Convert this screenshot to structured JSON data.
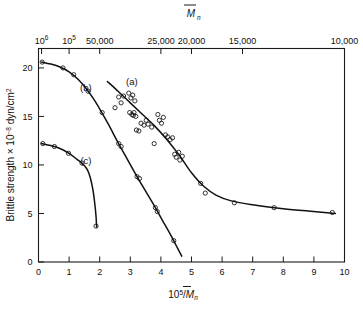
{
  "figure": {
    "width": 363,
    "height": 309,
    "background": "#ffffff",
    "ink_color": "#111111"
  },
  "chart_data": {
    "type": "scatter",
    "title": "",
    "subtitle": "",
    "xlabel": "10⁵/M̄ₙ",
    "ylabel": "Brittle strength × 10⁻⁸ dyn/cm²",
    "top_axis_label": "M̄ₙ",
    "xlim": [
      0,
      10
    ],
    "ylim": [
      0,
      22
    ],
    "grid": false,
    "legend_position": "inline-curve-labels",
    "x_ticks": [
      0,
      1,
      2,
      3,
      4,
      5,
      6,
      7,
      8,
      9,
      10
    ],
    "x_tick_labels": [
      "0",
      "1",
      "2",
      "3",
      "4",
      "5",
      "6",
      "7",
      "8",
      "9",
      "10"
    ],
    "y_ticks": [
      0,
      5,
      10,
      15,
      20
    ],
    "y_tick_labels": [
      "0",
      "5",
      "10",
      "15",
      "20"
    ],
    "top_ticks": [
      {
        "x": 0.1,
        "label": "10⁶",
        "sup": "6",
        "base": "10"
      },
      {
        "x": 1.0,
        "label": "10⁵",
        "sup": "5",
        "base": "10"
      },
      {
        "x": 2.0,
        "label": "50,000",
        "sup": "",
        "base": "50,000"
      },
      {
        "x": 4.0,
        "label": "25,000",
        "sup": "",
        "base": "25,000"
      },
      {
        "x": 5.0,
        "label": "20,000",
        "sup": "",
        "base": "20,000"
      },
      {
        "x": 6.667,
        "label": "15,000",
        "sup": "",
        "base": "15,000"
      },
      {
        "x": 10.0,
        "label": "10,000",
        "sup": "",
        "base": "10,000"
      }
    ],
    "series": [
      {
        "name": "(a)",
        "label": "(a)",
        "label_x": 3.05,
        "label_y": 18.2,
        "marker": "open-circle",
        "fit_curve": [
          [
            2.25,
            18.6
          ],
          [
            2.6,
            17.6
          ],
          [
            3.0,
            16.4
          ],
          [
            3.4,
            15.2
          ],
          [
            3.8,
            14.0
          ],
          [
            4.2,
            12.6
          ],
          [
            4.6,
            11.0
          ],
          [
            5.0,
            9.2
          ],
          [
            5.4,
            7.8
          ],
          [
            5.8,
            6.9
          ],
          [
            6.3,
            6.3
          ],
          [
            7.0,
            5.9
          ],
          [
            8.0,
            5.5
          ],
          [
            9.0,
            5.2
          ],
          [
            9.7,
            5.0
          ]
        ],
        "points": [
          [
            2.62,
            17.0
          ],
          [
            2.7,
            16.4
          ],
          [
            2.78,
            17.1
          ],
          [
            2.95,
            17.4
          ],
          [
            3.02,
            16.9
          ],
          [
            3.08,
            17.2
          ],
          [
            3.15,
            16.6
          ],
          [
            2.5,
            15.9
          ],
          [
            2.98,
            15.4
          ],
          [
            3.05,
            15.2
          ],
          [
            3.1,
            15.1
          ],
          [
            3.12,
            15.4
          ],
          [
            3.18,
            15.0
          ],
          [
            3.35,
            14.3
          ],
          [
            3.45,
            14.1
          ],
          [
            3.52,
            14.6
          ],
          [
            3.58,
            14.2
          ],
          [
            3.7,
            13.9
          ],
          [
            3.2,
            13.6
          ],
          [
            3.28,
            13.5
          ],
          [
            3.9,
            15.2
          ],
          [
            3.95,
            14.6
          ],
          [
            4.02,
            14.3
          ],
          [
            4.08,
            14.9
          ],
          [
            4.15,
            13.1
          ],
          [
            4.22,
            12.9
          ],
          [
            4.3,
            12.6
          ],
          [
            4.38,
            12.8
          ],
          [
            3.78,
            12.2
          ],
          [
            4.45,
            11.1
          ],
          [
            4.5,
            10.8
          ],
          [
            4.58,
            11.3
          ],
          [
            4.62,
            10.5
          ],
          [
            4.7,
            10.9
          ],
          [
            5.3,
            8.1
          ],
          [
            5.45,
            7.1
          ],
          [
            6.4,
            6.1
          ],
          [
            7.7,
            5.6
          ],
          [
            9.6,
            5.1
          ]
        ]
      },
      {
        "name": "(b)",
        "label": "(b)",
        "label_x": 1.55,
        "label_y": 17.6,
        "marker": "open-circle",
        "fit_curve": [
          [
            0.1,
            20.6
          ],
          [
            0.4,
            20.4
          ],
          [
            0.7,
            20.1
          ],
          [
            1.0,
            19.6
          ],
          [
            1.3,
            18.8
          ],
          [
            1.55,
            17.9
          ],
          [
            1.8,
            16.8
          ],
          [
            2.05,
            15.5
          ],
          [
            2.3,
            14.1
          ],
          [
            2.6,
            12.3
          ],
          [
            2.9,
            10.6
          ],
          [
            3.2,
            8.9
          ],
          [
            3.5,
            7.3
          ],
          [
            3.8,
            5.7
          ],
          [
            4.05,
            4.3
          ],
          [
            4.3,
            2.9
          ],
          [
            4.5,
            1.7
          ],
          [
            4.68,
            0.6
          ]
        ],
        "points": [
          [
            0.12,
            20.6
          ],
          [
            0.8,
            20.0
          ],
          [
            1.15,
            19.3
          ],
          [
            1.62,
            17.6
          ],
          [
            2.08,
            15.4
          ],
          [
            2.62,
            12.2
          ],
          [
            2.7,
            11.9
          ],
          [
            3.22,
            8.8
          ],
          [
            3.3,
            8.6
          ],
          [
            3.82,
            5.6
          ],
          [
            3.88,
            5.2
          ],
          [
            4.42,
            2.2
          ]
        ]
      },
      {
        "name": "(c)",
        "label": "(c)",
        "label_x": 1.55,
        "label_y": 10.1,
        "marker": "open-circle",
        "fit_curve": [
          [
            0.1,
            12.2
          ],
          [
            0.4,
            12.0
          ],
          [
            0.7,
            11.7
          ],
          [
            1.0,
            11.2
          ],
          [
            1.25,
            10.6
          ],
          [
            1.45,
            10.1
          ],
          [
            1.6,
            9.5
          ],
          [
            1.7,
            8.6
          ],
          [
            1.78,
            7.4
          ],
          [
            1.84,
            6.0
          ],
          [
            1.88,
            4.7
          ],
          [
            1.9,
            3.6
          ]
        ],
        "points": [
          [
            0.14,
            12.2
          ],
          [
            0.52,
            11.9
          ],
          [
            0.98,
            11.2
          ],
          [
            1.42,
            10.2
          ],
          [
            1.88,
            3.7
          ]
        ]
      }
    ]
  }
}
